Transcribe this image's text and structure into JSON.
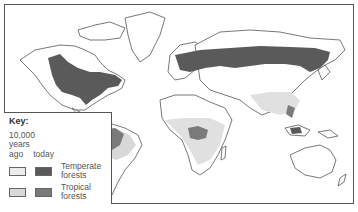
{
  "figure": {
    "colors": {
      "outline": "#555555",
      "temperate_past": "#ececec",
      "temperate_today": "#5a5a5a",
      "tropical_past": "#d8d8d8",
      "tropical_today": "#7a7a7a"
    }
  },
  "key": {
    "title": "Key:",
    "period_line1": "10,000",
    "period_line2": "years",
    "col_past": "ago",
    "col_today": "today",
    "items": [
      {
        "label_line1": "Temperate",
        "label_line2": "forests"
      },
      {
        "label_line1": "Tropical",
        "label_line2": "forests"
      }
    ]
  },
  "map": {
    "regions_shown": [
      "North America",
      "Greenland",
      "South America",
      "Europe",
      "Africa",
      "Asia",
      "Southeast Asia",
      "Australia",
      "New Zealand"
    ]
  }
}
